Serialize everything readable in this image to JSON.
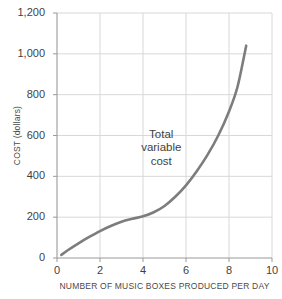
{
  "chart_data": {
    "type": "line",
    "title": "",
    "xlabel": "NUMBER OF MUSIC BOXES PRODUCED PER DAY",
    "ylabel": "COST (dollars)",
    "xlim": [
      0,
      10
    ],
    "ylim": [
      0,
      1200
    ],
    "xticks": [
      "0",
      "2",
      "4",
      "6",
      "8",
      "10"
    ],
    "xtick_values": [
      0,
      2,
      4,
      6,
      8,
      10
    ],
    "yticks": [
      "0",
      "200",
      "400",
      "600",
      "800",
      "1,000",
      "1,200"
    ],
    "ytick_values": [
      0,
      200,
      400,
      600,
      800,
      1000,
      1200
    ],
    "grid": true,
    "legend": "none",
    "line_color": "#7d7d7d",
    "grid_color": "#d8d8d8",
    "axis_color": "#9a9a9a",
    "series": [
      {
        "name": "Total variable cost",
        "x": [
          0.2,
          0.5,
          1.0,
          1.5,
          2.0,
          2.5,
          3.0,
          3.5,
          4.0,
          4.5,
          5.0,
          5.5,
          6.0,
          6.5,
          7.0,
          7.5,
          8.0,
          8.4,
          8.8
        ],
        "values": [
          15,
          38,
          72,
          103,
          132,
          157,
          178,
          192,
          204,
          224,
          255,
          300,
          356,
          425,
          505,
          600,
          718,
          840,
          1040
        ]
      }
    ],
    "annotations": [
      {
        "name": "total-variable-cost-label",
        "lines": [
          "Total",
          "variable",
          "cost"
        ],
        "x": 4.85,
        "y": 535
      }
    ]
  }
}
